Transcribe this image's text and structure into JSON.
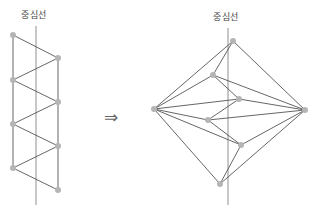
{
  "labels": {
    "left_center_line": "중심선",
    "right_center_line": "중심선",
    "arrow": "⇒"
  },
  "colors": {
    "edge": "#555555",
    "center_line": "#999999",
    "node": "#b5b5b5"
  },
  "left_diagram": {
    "center_line": {
      "x": 36,
      "y1": 26,
      "y2": 205
    },
    "nodes": [
      {
        "x": 13,
        "y": 35
      },
      {
        "x": 58,
        "y": 58
      },
      {
        "x": 13,
        "y": 80
      },
      {
        "x": 58,
        "y": 102
      },
      {
        "x": 13,
        "y": 124
      },
      {
        "x": 58,
        "y": 146
      },
      {
        "x": 13,
        "y": 168
      },
      {
        "x": 58,
        "y": 190
      }
    ],
    "edges": [
      [
        0,
        1
      ],
      [
        1,
        2
      ],
      [
        2,
        3
      ],
      [
        3,
        4
      ],
      [
        4,
        5
      ],
      [
        5,
        6
      ],
      [
        6,
        7
      ],
      [
        0,
        6
      ],
      [
        1,
        7
      ]
    ]
  },
  "right_diagram": {
    "center_line": {
      "x": 228,
      "y1": 28,
      "y2": 205
    },
    "nodes": [
      {
        "x": 233,
        "y": 41
      },
      {
        "x": 213,
        "y": 75
      },
      {
        "x": 154,
        "y": 109
      },
      {
        "x": 305,
        "y": 110
      },
      {
        "x": 239,
        "y": 99
      },
      {
        "x": 208,
        "y": 120
      },
      {
        "x": 241,
        "y": 145
      },
      {
        "x": 220,
        "y": 184
      }
    ],
    "edges": [
      [
        0,
        2
      ],
      [
        0,
        3
      ],
      [
        0,
        1
      ],
      [
        1,
        2
      ],
      [
        1,
        3
      ],
      [
        1,
        4
      ],
      [
        2,
        4
      ],
      [
        2,
        5
      ],
      [
        2,
        6
      ],
      [
        2,
        7
      ],
      [
        4,
        3
      ],
      [
        4,
        5
      ],
      [
        5,
        3
      ],
      [
        5,
        6
      ],
      [
        6,
        3
      ],
      [
        6,
        7
      ],
      [
        7,
        3
      ]
    ]
  }
}
